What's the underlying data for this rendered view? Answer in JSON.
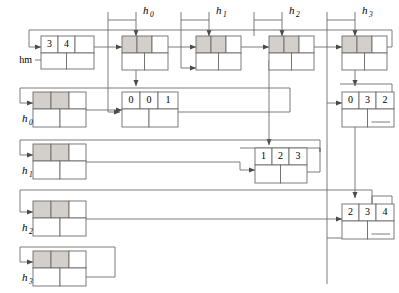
{
  "figure": {
    "kind": "linked-structure-diagram",
    "background": "#ffffff",
    "line_color": "#6d6d6d",
    "node_stroke": "#6d6d6d",
    "shaded_cell_color": "#d3d0cb",
    "white_cell_color": "#ffffff"
  },
  "labels": {
    "hm": "hm",
    "top": [
      {
        "base": "h",
        "sub": "0"
      },
      {
        "base": "h",
        "sub": "1"
      },
      {
        "base": "h",
        "sub": "2"
      },
      {
        "base": "h",
        "sub": "3"
      }
    ],
    "left": [
      {
        "base": "h",
        "sub": "0"
      },
      {
        "base": "h",
        "sub": "1"
      },
      {
        "base": "h",
        "sub": "2"
      },
      {
        "base": "h",
        "sub": "3"
      }
    ]
  },
  "nodes": {
    "hm_node": {
      "name": "node-hm",
      "cells": [
        "3",
        "4",
        ""
      ],
      "shaded": [
        false,
        false,
        false
      ]
    },
    "row0_col0": {
      "name": "node-row0-col0",
      "cells": [
        "",
        "",
        ""
      ],
      "shaded": [
        true,
        true,
        false
      ]
    },
    "row0_col1": {
      "name": "node-row0-col1",
      "cells": [
        "",
        "",
        ""
      ],
      "shaded": [
        true,
        true,
        false
      ]
    },
    "row0_col2": {
      "name": "node-row0-col2",
      "cells": [
        "",
        "",
        ""
      ],
      "shaded": [
        true,
        true,
        false
      ]
    },
    "row0_col3": {
      "name": "node-row0-col3",
      "cells": [
        "",
        "",
        ""
      ],
      "shaded": [
        true,
        true,
        false
      ]
    },
    "row1_left": {
      "name": "node-row1-left",
      "cells": [
        "",
        "",
        ""
      ],
      "shaded": [
        true,
        true,
        false
      ]
    },
    "row1_mid": {
      "name": "node-001",
      "cells": [
        "0",
        "0",
        "1"
      ],
      "shaded": [
        false,
        false,
        false
      ]
    },
    "row1_right": {
      "name": "node-032",
      "cells": [
        "0",
        "3",
        "2"
      ],
      "shaded": [
        false,
        false,
        false
      ]
    },
    "row2_left": {
      "name": "node-row2-left",
      "cells": [
        "",
        "",
        ""
      ],
      "shaded": [
        true,
        true,
        false
      ]
    },
    "row2_mid": {
      "name": "node-123",
      "cells": [
        "1",
        "2",
        "3"
      ],
      "shaded": [
        false,
        false,
        false
      ]
    },
    "row3_left": {
      "name": "node-row3-left",
      "cells": [
        "",
        "",
        ""
      ],
      "shaded": [
        true,
        true,
        false
      ]
    },
    "row3_right": {
      "name": "node-234",
      "cells": [
        "2",
        "3",
        "4"
      ],
      "shaded": [
        false,
        false,
        false
      ]
    },
    "row4_left": {
      "name": "node-row4-left",
      "cells": [
        "",
        "",
        ""
      ],
      "shaded": [
        true,
        true,
        false
      ]
    }
  }
}
